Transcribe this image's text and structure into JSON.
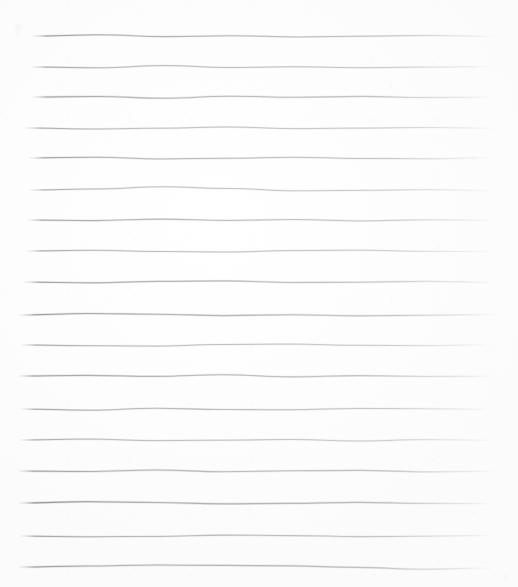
{
  "document": {
    "title": "Hand-drawn ruled lines on white paper",
    "medium": "graphite pencil on paper",
    "width": 518,
    "height": 587,
    "background_color": "#fefefe",
    "paper_tone": "#fdfdfd",
    "ink_color": "#8c8c92",
    "ink_color_dark": "#6e6e76",
    "ink_color_light": "#bfbfc6",
    "line_count": 18,
    "orientation": "horizontal",
    "average_spacing_px": 31,
    "left_margin_px": 20,
    "right_margin_px": 23,
    "description": "A blank sheet of white paper bearing eighteen freehand horizontal pencil lines ruled from the upper edge to the lower edge. Each stroke is slightly wavy and uneven, darker where the pencil first bites at the left and tapering to a faint point at the right."
  },
  "lines": [
    {
      "id": "line-1",
      "index": 1,
      "y": 36,
      "x_start": 33,
      "x_end": 497,
      "weight": 1.05,
      "opacity": 0.62,
      "wave": [
        0,
        -1.2,
        0.6,
        -0.3,
        1.0,
        0.2,
        -0.6,
        0.4
      ]
    },
    {
      "id": "line-2",
      "index": 2,
      "y": 67,
      "x_start": 32,
      "x_end": 494,
      "weight": 1.0,
      "opacity": 0.55,
      "wave": [
        0,
        0.8,
        -1.4,
        0.5,
        -0.2,
        0.7,
        0.1,
        -0.4
      ]
    },
    {
      "id": "line-3",
      "index": 3,
      "y": 97,
      "x_start": 33,
      "x_end": 492,
      "weight": 1.1,
      "opacity": 0.6,
      "wave": [
        0,
        -0.5,
        1.2,
        -0.8,
        0.3,
        -0.6,
        0.5,
        0.2
      ]
    },
    {
      "id": "line-4",
      "index": 4,
      "y": 128,
      "x_start": 26,
      "x_end": 496,
      "weight": 1.0,
      "opacity": 0.52,
      "wave": [
        0,
        1.0,
        0.2,
        -1.0,
        0.6,
        0.1,
        -0.5,
        0.3
      ]
    },
    {
      "id": "line-5",
      "index": 5,
      "y": 158,
      "x_start": 30,
      "x_end": 490,
      "weight": 1.05,
      "opacity": 0.58,
      "wave": [
        0,
        -0.8,
        0.9,
        0.3,
        -0.7,
        0.4,
        0.8,
        -0.2
      ]
    },
    {
      "id": "line-6",
      "index": 6,
      "y": 190,
      "x_start": 30,
      "x_end": 493,
      "weight": 1.0,
      "opacity": 0.5,
      "wave": [
        0,
        -1.0,
        -3.2,
        -1.5,
        0.8,
        0.4,
        -0.3,
        0.5
      ]
    },
    {
      "id": "line-7",
      "index": 7,
      "y": 220,
      "x_start": 28,
      "x_end": 495,
      "weight": 1.05,
      "opacity": 0.57,
      "wave": [
        0,
        0.6,
        -0.9,
        0.4,
        -0.5,
        0.9,
        -0.2,
        0.3
      ]
    },
    {
      "id": "line-8",
      "index": 8,
      "y": 251,
      "x_start": 27,
      "x_end": 492,
      "weight": 1.0,
      "opacity": 0.53,
      "wave": [
        0,
        -0.7,
        0.5,
        1.0,
        -0.4,
        -0.8,
        0.3,
        0.6
      ]
    },
    {
      "id": "line-9",
      "index": 9,
      "y": 282,
      "x_start": 25,
      "x_end": 494,
      "weight": 1.1,
      "opacity": 0.6,
      "wave": [
        0,
        0.9,
        -0.6,
        -1.1,
        0.5,
        0.2,
        -0.7,
        0.4
      ]
    },
    {
      "id": "line-10",
      "index": 10,
      "y": 315,
      "x_start": 20,
      "x_end": 496,
      "weight": 1.15,
      "opacity": 0.64,
      "wave": [
        0,
        -1.5,
        -0.8,
        0.6,
        -0.3,
        0.8,
        0.2,
        -0.5
      ]
    },
    {
      "id": "line-11",
      "index": 11,
      "y": 345,
      "x_start": 22,
      "x_end": 490,
      "weight": 1.0,
      "opacity": 0.54,
      "wave": [
        0,
        0.7,
        1.1,
        -0.5,
        -0.9,
        0.3,
        0.6,
        -0.2
      ]
    },
    {
      "id": "line-12",
      "index": 12,
      "y": 376,
      "x_start": 19,
      "x_end": 495,
      "weight": 1.1,
      "opacity": 0.61,
      "wave": [
        0,
        -0.6,
        0.4,
        -1.3,
        0.9,
        -0.4,
        0.5,
        0.3
      ]
    },
    {
      "id": "line-13",
      "index": 13,
      "y": 409,
      "x_start": 21,
      "x_end": 492,
      "weight": 1.05,
      "opacity": 0.56,
      "wave": [
        0,
        1.2,
        -0.7,
        0.5,
        0.8,
        -0.6,
        -0.3,
        0.4
      ]
    },
    {
      "id": "line-14",
      "index": 14,
      "y": 440,
      "x_start": 20,
      "x_end": 494,
      "weight": 1.0,
      "opacity": 0.52,
      "wave": [
        0,
        -0.9,
        0.6,
        0.2,
        -0.5,
        1.0,
        -0.4,
        0.3
      ]
    },
    {
      "id": "line-15",
      "index": 15,
      "y": 471,
      "x_start": 19,
      "x_end": 496,
      "weight": 1.1,
      "opacity": 0.6,
      "wave": [
        0,
        0.5,
        -1.0,
        0.7,
        -0.2,
        -0.6,
        0.9,
        0.2
      ]
    },
    {
      "id": "line-16",
      "index": 16,
      "y": 503,
      "x_start": 20,
      "x_end": 492,
      "weight": 1.2,
      "opacity": 0.66,
      "wave": [
        0,
        -1.3,
        -0.5,
        0.8,
        0.3,
        -0.7,
        0.4,
        0.6
      ]
    },
    {
      "id": "line-17",
      "index": 17,
      "y": 536,
      "x_start": 21,
      "x_end": 495,
      "weight": 1.05,
      "opacity": 0.57,
      "wave": [
        0,
        0.8,
        0.4,
        -0.9,
        -0.4,
        0.6,
        0.2,
        -0.5
      ]
    },
    {
      "id": "line-18",
      "index": 18,
      "y": 567,
      "x_start": 20,
      "x_end": 490,
      "weight": 1.15,
      "opacity": 0.63,
      "wave": [
        0,
        -1.0,
        -2.0,
        -1.6,
        -1.2,
        0.4,
        2.2,
        1.0
      ]
    }
  ],
  "marks": [
    {
      "id": "mark-1",
      "name": "smudge-top-left",
      "x": 14,
      "y": 22,
      "w": 9,
      "h": 11,
      "opacity": 0.07
    },
    {
      "id": "mark-2",
      "name": "smudge-top-left-dot",
      "x": 16,
      "y": 31,
      "w": 4,
      "h": 5,
      "opacity": 0.06
    },
    {
      "id": "mark-3",
      "name": "smudge-bottom-right",
      "x": 503,
      "y": 572,
      "w": 7,
      "h": 9,
      "opacity": 0.05
    }
  ]
}
